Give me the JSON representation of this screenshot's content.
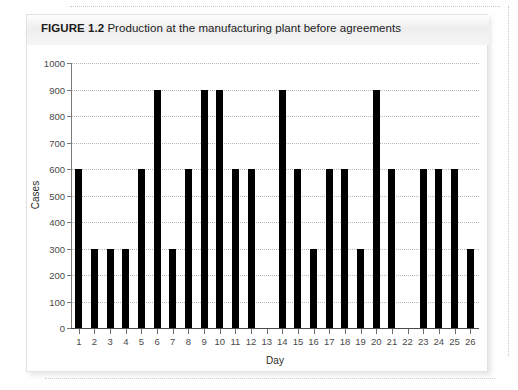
{
  "figure": {
    "label": "FIGURE 1.2",
    "caption": "Production at the manufacturing plant before agreements",
    "header_bg": "#eeeeee",
    "card_bg": "#ffffff"
  },
  "chart_data": {
    "type": "bar",
    "title": "Production at the manufacturing plant before agreements",
    "xlabel": "Day",
    "ylabel": "Cases",
    "categories": [
      "1",
      "2",
      "3",
      "4",
      "5",
      "6",
      "7",
      "8",
      "9",
      "10",
      "11",
      "12",
      "13",
      "14",
      "15",
      "16",
      "17",
      "18",
      "19",
      "20",
      "21",
      "22",
      "23",
      "24",
      "25",
      "26"
    ],
    "values": [
      600,
      300,
      300,
      300,
      600,
      900,
      300,
      600,
      900,
      900,
      600,
      600,
      0,
      900,
      600,
      300,
      600,
      600,
      300,
      900,
      600,
      0,
      600,
      600,
      600,
      300
    ],
    "ylim": [
      0,
      1000
    ],
    "ytick_values": [
      0,
      100,
      200,
      300,
      400,
      500,
      600,
      700,
      800,
      900,
      1000
    ],
    "ytick_labels": [
      "0",
      "100",
      "200",
      "300",
      "400",
      "500",
      "600",
      "700",
      "800",
      "900",
      "1000"
    ],
    "grid": true,
    "grid_axis": "y",
    "grid_style": "dotted",
    "grid_color": "#b8b8b8",
    "bar_color": "#000000",
    "legend": null,
    "legend_position": "none"
  }
}
